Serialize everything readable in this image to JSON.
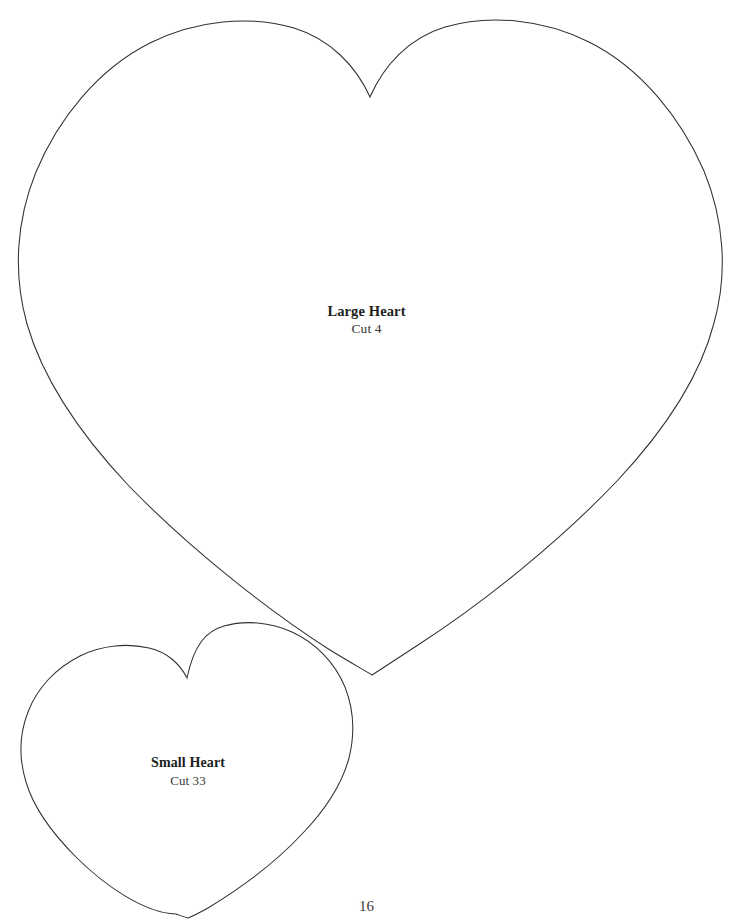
{
  "page": {
    "kind": "pattern-template-sheet",
    "page_number": "16",
    "background_color": "#ffffff",
    "outline_color": "#33312f",
    "text_color": "#201e1d"
  },
  "shapes": [
    {
      "id": "large-heart",
      "name": "Large Heart",
      "title": "Large Heart",
      "cut_label": "Cut 4",
      "cut_count": 4,
      "outline_color": "#33312f",
      "fill_color": "#ffffff",
      "bounds": {
        "left": 16,
        "top": 24,
        "right": 722,
        "bottom": 676
      },
      "anchors": {
        "top_notch": [
          370,
          97
        ],
        "left_extreme": [
          16,
          232
        ],
        "right_extreme": [
          722,
          235
        ],
        "bottom_point": [
          372,
          675
        ],
        "left_lobe_peak": [
          218,
          25
        ],
        "right_lobe_peak": [
          520,
          25
        ]
      },
      "path": "M 370 97 C 356 66 330 39 294 28 C 250 15 196 20 150 43 C 98 69 58 119 36 172 C 16 221 13 274 27 324 C 44 383 82 436 128 485 C 186 545 263 607 330 650 C 348 661 362 669 372 675 C 383 668 398 658 418 645 C 486 601 561 540 617 481 C 662 433 699 381 714 323 C 728 273 724 220 704 171 C 681 118 641 68 589 42 C 543 19 489 14 445 27 C 409 38 384 65 370 97 Z"
    },
    {
      "id": "small-heart",
      "name": "Small Heart",
      "title": "Small Heart",
      "cut_label": "Cut 33",
      "cut_count": 33,
      "outline_color": "#33312f",
      "fill_color": "#ffffff",
      "bounds": {
        "left": 21,
        "top": 644,
        "right": 353,
        "bottom": 919
      },
      "anchors": {
        "top_notch": [
          187,
          678
        ],
        "left_extreme": [
          21,
          733
        ],
        "right_extreme": [
          353,
          735
        ],
        "bottom_point": [
          188,
          918
        ],
        "left_lobe_peak": [
          97,
          645
        ],
        "right_lobe_peak": [
          263,
          645
        ]
      },
      "path": "M 187 678 C 180 664 167 652 149 648 C 128 643 102 645 80 656 C 56 668 37 688 28 712 C 19 735 19 759 26 782 C 34 809 53 834 76 857 C 104 885 144 913 176 914 C 179 915 184 917 188 918 C 193 916 199 913 208 908 C 241 888 277 861 303 833 C 325 810 342 784 349 758 C 355 734 354 710 345 687 C 335 663 316 643 292 632 C 270 622 245 620 224 626 C 206 631 194 645 187 678 Z"
    }
  ],
  "labels": {
    "large_heart": {
      "title": "Large Heart",
      "sub": "Cut 4"
    },
    "small_heart": {
      "title": "Small Heart",
      "sub": "Cut 33"
    }
  },
  "footer": {
    "page_number": "16"
  }
}
